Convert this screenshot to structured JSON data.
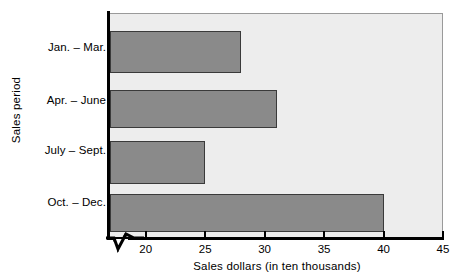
{
  "chart_data": {
    "type": "bar",
    "orientation": "horizontal",
    "title": "",
    "xlabel": "Sales dollars (in ten thousands)",
    "ylabel": "Sales period",
    "categories": [
      "Jan. – Mar.",
      "Apr. – June",
      "July – Sept.",
      "Oct. – Dec."
    ],
    "values": [
      28,
      31,
      25,
      40
    ],
    "xlim": [
      17,
      45
    ],
    "xticks": [
      20,
      25,
      30,
      35,
      40,
      45
    ],
    "xtick_labels": [
      "20",
      "25",
      "30",
      "35",
      "40",
      "45"
    ],
    "grid": false,
    "legend": false,
    "axis_break": true,
    "colors": {
      "bar_fill": "#8a8a8a",
      "bar_border": "#3a3a3a",
      "plot_background": "#ededed",
      "axis": "#000000",
      "page_background": "#ffffff"
    }
  }
}
